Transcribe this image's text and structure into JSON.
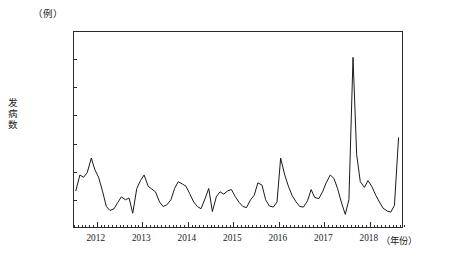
{
  "figure": {
    "unit_label": "（例）",
    "caption_partial": ""
  },
  "chart_data": {
    "type": "line",
    "title": "",
    "subtitle": "",
    "unit": "例",
    "xlabel": "年份",
    "ylabel": "发病数",
    "xlabel_display": "（年份）",
    "ylim": [
      100000,
      450000
    ],
    "ytick_step": 50000,
    "yticks": [
      100000,
      150000,
      200000,
      250000,
      300000,
      350000,
      400000,
      450000
    ],
    "ytick_labels": [
      "100 000",
      "150 000",
      "200 000",
      "250 000",
      "300 000",
      "350 000",
      "400 000",
      "450 000"
    ],
    "xlim": [
      2011.5,
      2018.75
    ],
    "xticks": [
      2012,
      2013,
      2014,
      2015,
      2016,
      2017,
      2018
    ],
    "xtick_labels": [
      "2012",
      "2013",
      "2014",
      "2015",
      "2016",
      "2017",
      "2018"
    ],
    "x_minor_tick_interval_months": 1,
    "grid": false,
    "legend": false,
    "line_color": "#1a1a1a",
    "line_width": 1.0,
    "series": [
      {
        "name": "发病数",
        "x": [
          2011.54,
          2011.63,
          2011.71,
          2011.79,
          2011.88,
          2011.96,
          2012.04,
          2012.13,
          2012.21,
          2012.29,
          2012.38,
          2012.46,
          2012.54,
          2012.63,
          2012.71,
          2012.79,
          2012.88,
          2012.96,
          2013.04,
          2013.13,
          2013.21,
          2013.29,
          2013.38,
          2013.46,
          2013.54,
          2013.63,
          2013.71,
          2013.79,
          2013.88,
          2013.96,
          2014.04,
          2014.13,
          2014.21,
          2014.29,
          2014.38,
          2014.46,
          2014.54,
          2014.63,
          2014.71,
          2014.79,
          2014.88,
          2014.96,
          2015.04,
          2015.13,
          2015.21,
          2015.29,
          2015.38,
          2015.46,
          2015.54,
          2015.63,
          2015.71,
          2015.79,
          2015.88,
          2015.96,
          2016.04,
          2016.13,
          2016.21,
          2016.29,
          2016.38,
          2016.46,
          2016.54,
          2016.63,
          2016.71,
          2016.79,
          2016.88,
          2016.96,
          2017.04,
          2017.13,
          2017.21,
          2017.29,
          2017.38,
          2017.46,
          2017.54,
          2017.63,
          2017.71,
          2017.79,
          2017.88,
          2017.96,
          2018.04,
          2018.13,
          2018.21,
          2018.29,
          2018.38,
          2018.46,
          2018.54,
          2018.63
        ],
        "values": [
          168000,
          196000,
          192000,
          200000,
          226000,
          205000,
          192000,
          166000,
          140000,
          133000,
          136000,
          147000,
          157000,
          152000,
          155000,
          128000,
          172000,
          186000,
          196000,
          176000,
          171000,
          166000,
          148000,
          140000,
          143000,
          152000,
          172000,
          184000,
          180000,
          176000,
          163000,
          148000,
          140000,
          136000,
          154000,
          172000,
          131000,
          158000,
          166000,
          162000,
          168000,
          170000,
          158000,
          147000,
          140000,
          138000,
          152000,
          160000,
          182000,
          178000,
          152000,
          141000,
          139000,
          148000,
          226000,
          196000,
          176000,
          160000,
          148000,
          140000,
          139000,
          150000,
          170000,
          156000,
          154000,
          166000,
          182000,
          196000,
          190000,
          172000,
          146000,
          126000,
          152000,
          405000,
          232000,
          184000,
          174000,
          186000,
          176000,
          160000,
          148000,
          137000,
          132000,
          130000,
          142000,
          262000
        ]
      }
    ],
    "annotations": [
      {
        "label": "peak",
        "x": 2017.63,
        "y": 405000
      },
      {
        "label": "secondary-peak",
        "x": 2016.04,
        "y": 226000
      },
      {
        "label": "final-rise",
        "x": 2018.63,
        "y": 262000
      },
      {
        "label": "minimum",
        "x": 2017.46,
        "y": 126000
      }
    ]
  }
}
